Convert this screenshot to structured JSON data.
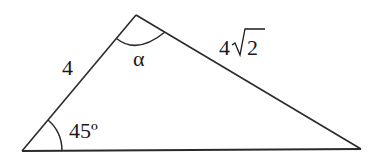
{
  "diagram": {
    "type": "triangle",
    "vertices": {
      "left": [
        22,
        151
      ],
      "apex": [
        136,
        15
      ],
      "right": [
        361,
        149
      ]
    },
    "side_labels": {
      "left_side": "4",
      "right_side_coef": "4",
      "right_side_radicand": "2"
    },
    "angle_labels": {
      "apex": "α",
      "left": "45º"
    },
    "stroke_color": "#2a2a2a"
  }
}
